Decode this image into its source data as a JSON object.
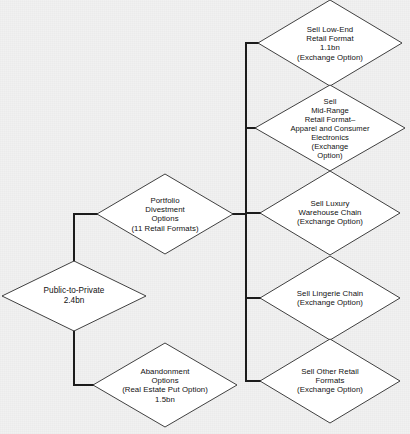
{
  "diagram": {
    "type": "decision-tree-flowchart",
    "background_color": "#f1f1f1",
    "node_fill": "#ffffff",
    "node_stroke": "#2b2b2b",
    "connector_color": "#1c1c1c",
    "nodes": [
      {
        "id": "public-to-private",
        "label": "Public-to-Private\n2.4bn",
        "cx": 74,
        "cy": 296,
        "rx": 72,
        "ry": 35,
        "font_size": 8.2
      },
      {
        "id": "portfolio-divestment-options",
        "label": "Portfolio\nDivestment\nOptions\n(11 Retail Formats)",
        "cx": 165,
        "cy": 214,
        "rx": 68,
        "ry": 40,
        "font_size": 7.8
      },
      {
        "id": "abandonment-options",
        "label": "Abandonment\nOptions\n(Real Estate Put Option)\n1.5bn",
        "cx": 165,
        "cy": 385,
        "rx": 72,
        "ry": 42,
        "font_size": 7.8
      },
      {
        "id": "sell-low-end-retail-format",
        "label": "Sell Low-End\nRetail Format\n1.1bn\n(Exchange Option)",
        "cx": 330,
        "cy": 43,
        "rx": 72,
        "ry": 43,
        "font_size": 7.8
      },
      {
        "id": "sell-mid-range-retail-format",
        "label": "Sell\nMid-Range\nRetail Format–\nApparel and Consumer\nElectronics\n(Exchange\nOption)",
        "cx": 330,
        "cy": 128,
        "rx": 75,
        "ry": 43,
        "font_size": 7.6
      },
      {
        "id": "sell-luxury-warehouse-chain",
        "label": "Sell Luxury\nWarehouse Chain\n(Exchange Option)",
        "cx": 330,
        "cy": 213,
        "rx": 70,
        "ry": 42,
        "font_size": 7.8
      },
      {
        "id": "sell-lingerie-chain",
        "label": "Sell Lingerie Chain\n(Exchange Option)",
        "cx": 330,
        "cy": 298,
        "rx": 70,
        "ry": 42,
        "font_size": 7.8
      },
      {
        "id": "sell-other-retail-formats",
        "label": "Sell Other Retail\nFormats\n(Exchange Option)",
        "cx": 330,
        "cy": 381,
        "rx": 70,
        "ry": 42,
        "font_size": 7.8
      }
    ],
    "connectors": [
      {
        "id": "ptp-to-portfolio",
        "points": "74,261 74,214 97,214"
      },
      {
        "id": "ptp-to-abandonment",
        "points": "74,331 74,385 93,385"
      },
      {
        "id": "portfolio-to-spine",
        "points": "233,214 246,214"
      },
      {
        "id": "spine-vertical",
        "points": "246,43 246,381"
      },
      {
        "id": "spine-to-low-end",
        "points": "246,43 259,43"
      },
      {
        "id": "spine-to-mid-range",
        "points": "246,128 256,128"
      },
      {
        "id": "spine-to-luxury",
        "points": "246,213 260,213"
      },
      {
        "id": "spine-to-lingerie",
        "points": "246,298 260,298"
      },
      {
        "id": "spine-to-other",
        "points": "246,381 260,381"
      }
    ]
  }
}
